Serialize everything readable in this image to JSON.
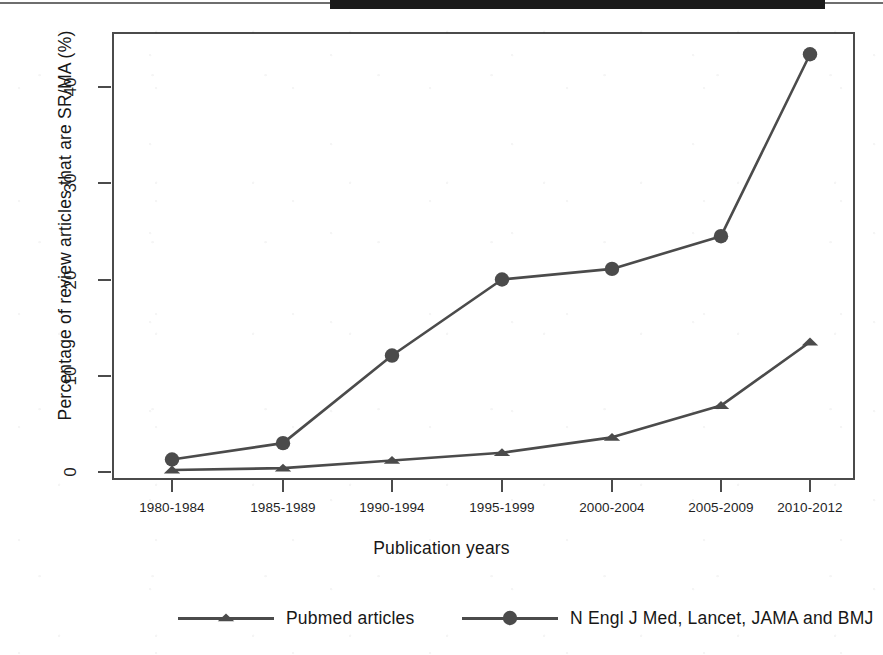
{
  "figure": {
    "background_color": "#ffffff",
    "line_color": "#4b4b4b",
    "text_color": "#1f1f1f",
    "scan_artifact": "dark-band-top-edge"
  },
  "axes": {
    "y_title": "Percentage of review articles that are SR/MA (%)",
    "x_title": "Publication years",
    "y_ticks": [
      "0",
      "10",
      "20",
      "30",
      "40"
    ],
    "x_ticks": [
      "1980-1984",
      "1985-1989",
      "1990-1994",
      "1995-1999",
      "2000-2004",
      "2005-2009",
      "2010-2012"
    ]
  },
  "legend": {
    "entries": [
      {
        "label": "Pubmed articles",
        "marker": "triangle-marker"
      },
      {
        "label": "N Engl J Med, Lancet, JAMA and BMJ",
        "marker": "circle-marker"
      }
    ]
  },
  "chart_data": {
    "type": "line",
    "title": "",
    "xlabel": "Publication years",
    "ylabel": "Percentage of review articles that are SR/MA (%)",
    "categories": [
      "1980-1984",
      "1985-1989",
      "1990-1994",
      "1995-1999",
      "2000-2004",
      "2005-2009",
      "2010-2012"
    ],
    "series": [
      {
        "name": "Pubmed articles",
        "marker": "triangle",
        "color": "#4b4b4b",
        "values": [
          0.2,
          0.4,
          1.2,
          2.0,
          3.6,
          6.9,
          13.5
        ]
      },
      {
        "name": "N Engl J Med, Lancet, JAMA and BMJ",
        "marker": "circle",
        "color": "#4b4b4b",
        "values": [
          1.3,
          3.0,
          12.1,
          20.0,
          21.1,
          24.5,
          43.4
        ]
      }
    ],
    "ylim": [
      -1.2,
      45.5
    ],
    "yticks": [
      0,
      10,
      20,
      30,
      40
    ],
    "grid": false,
    "legend_position": "below"
  }
}
